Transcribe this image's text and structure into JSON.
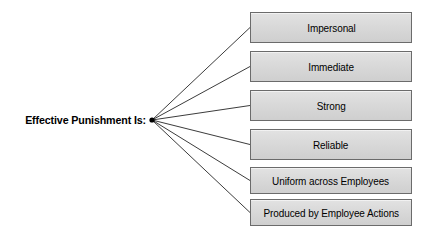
{
  "diagram": {
    "type": "fan-out concept diagram",
    "root": {
      "label": "Effective Punishment Is:",
      "anchor_x": 152,
      "anchor_y": 120
    },
    "colors": {
      "box_fill": "#d9d9d9",
      "box_border": "#6b6b6b",
      "connector": "#3c3c3c",
      "text": "#000000",
      "background": "#ffffff"
    },
    "nodes": [
      {
        "label": "Impersonal",
        "center_y": 27.5
      },
      {
        "label": "Immediate",
        "center_y": 66.5
      },
      {
        "label": "Strong",
        "center_y": 105.5
      },
      {
        "label": "Reliable",
        "center_y": 144.5
      },
      {
        "label": "Uniform across Employees",
        "center_y": 180.5
      },
      {
        "label": "Produced by Employee Actions",
        "center_y": 212.5
      }
    ]
  }
}
